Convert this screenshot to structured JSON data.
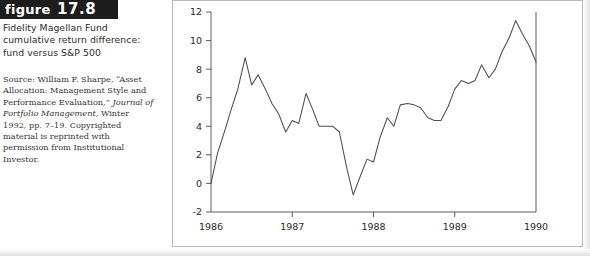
{
  "figure": {
    "banner_word": "figure",
    "banner_number": "17.8",
    "title": "Fidelity Magellan Fund cumulative return difference: fund versus S&P 500",
    "source_prefix": "Source: William F. Sharpe, “Asset Allocation: Management Style and Performance Evaluation,” ",
    "source_italic": "Journal of Portfolio Management,",
    "source_suffix": " Winter 1992, pp. 7–19. Copyrighted material is reprinted with permission from Institutional Investor."
  },
  "chart_data": {
    "type": "line",
    "title": "Fidelity Magellan Fund cumulative return difference: fund versus S&P 500",
    "xlabel": "",
    "ylabel": "",
    "xlim": [
      1986.0,
      1990.0
    ],
    "ylim": [
      -2,
      12
    ],
    "xticks": [
      "1986",
      "1987",
      "1988",
      "1989",
      "1990"
    ],
    "xtick_values": [
      1986,
      1987,
      1988,
      1989,
      1990
    ],
    "yticks": [
      "-2",
      "0",
      "2",
      "4",
      "6",
      "8",
      "10",
      "12"
    ],
    "ytick_values": [
      -2,
      0,
      2,
      4,
      6,
      8,
      10,
      12
    ],
    "grid": false,
    "legend": false,
    "series": [
      {
        "name": "Cumulative return difference (%)",
        "x": [
          1986.0,
          1986.08,
          1986.17,
          1986.25,
          1986.33,
          1986.42,
          1986.5,
          1986.58,
          1986.67,
          1986.75,
          1986.83,
          1986.92,
          1987.0,
          1987.08,
          1987.17,
          1987.25,
          1987.33,
          1987.42,
          1987.5,
          1987.58,
          1987.67,
          1987.75,
          1987.83,
          1987.92,
          1988.0,
          1988.08,
          1988.17,
          1988.25,
          1988.33,
          1988.42,
          1988.5,
          1988.58,
          1988.67,
          1988.75,
          1988.83,
          1988.92,
          1989.0,
          1989.08,
          1989.17,
          1989.25,
          1989.33,
          1989.42,
          1989.5,
          1989.58,
          1989.67,
          1989.75,
          1989.83,
          1989.92,
          1990.0
        ],
        "values": [
          0.0,
          2.1,
          3.7,
          5.2,
          6.6,
          8.8,
          6.9,
          7.6,
          6.6,
          5.6,
          4.9,
          3.6,
          4.4,
          4.2,
          6.3,
          5.2,
          4.0,
          4.0,
          4.0,
          3.6,
          1.1,
          -0.8,
          0.4,
          1.7,
          1.5,
          3.2,
          4.6,
          4.0,
          5.5,
          5.6,
          5.5,
          5.3,
          4.6,
          4.4,
          4.4,
          5.4,
          6.6,
          7.2,
          7.0,
          7.2,
          8.3,
          7.4,
          8.0,
          9.2,
          10.2,
          11.4,
          10.5,
          9.6,
          8.5
        ]
      }
    ]
  }
}
